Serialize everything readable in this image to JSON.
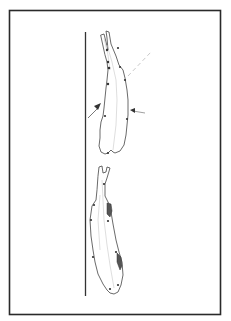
{
  "figure": {
    "type": "line-drawing",
    "upper_animal": {
      "label": "animal-top-view-upper",
      "arrows": [
        "left-arrow",
        "right-arrow"
      ],
      "guide_line": "dashed"
    },
    "lower_animal": {
      "label": "animal-top-view-lower",
      "shaded_marks": 2
    },
    "colors": {
      "frame": "#2a2a2a",
      "line": "#444444",
      "dash": "#c9c9c9",
      "background": "#ffffff"
    }
  }
}
